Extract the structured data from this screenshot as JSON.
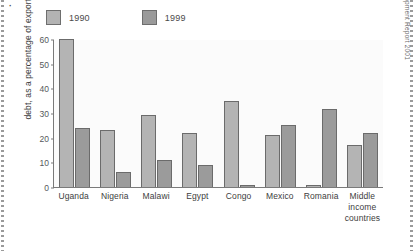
{
  "chart_data": {
    "type": "bar",
    "title": "",
    "xlabel": "",
    "ylabel": "debt, as a percentage of exports",
    "ylim": [
      0,
      60
    ],
    "yticks": [
      0,
      10,
      20,
      30,
      40,
      50,
      60
    ],
    "grid": false,
    "legend_position": "top-left",
    "categories": [
      "Uganda",
      "Nigeria",
      "Malawi",
      "Egypt",
      "Congo",
      "Mexico",
      "Romania",
      "Middle income countries"
    ],
    "series": [
      {
        "name": "1990",
        "color": "#b4b4b4",
        "values": [
          60,
          23,
          29,
          22,
          35,
          21,
          1,
          17
        ]
      },
      {
        "name": "1999",
        "color": "#9b9b9b",
        "values": [
          24,
          6,
          11,
          9,
          1,
          25,
          31.5,
          22
        ]
      }
    ],
    "source": "Source: UNDP Human Development Report 2001"
  },
  "corner_mark": "·",
  "legend": {
    "items": [
      {
        "label": "1990"
      },
      {
        "label": "1999"
      }
    ]
  }
}
